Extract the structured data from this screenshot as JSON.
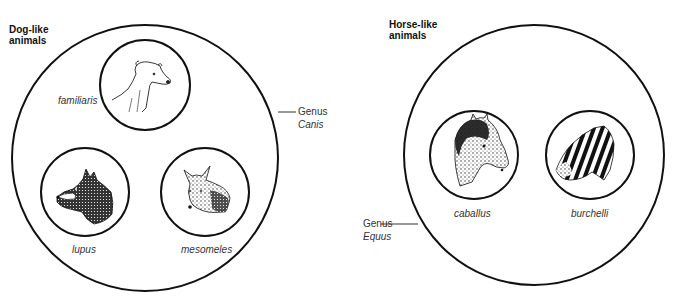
{
  "groups": [
    {
      "id": "dog",
      "title_line1": "Dog-like",
      "title_line2": "animals",
      "genus_label": "Genus",
      "genus_name": "Canis",
      "species": [
        {
          "name": "familiaris",
          "animal": "domestic dog"
        },
        {
          "name": "lupus",
          "animal": "wolf"
        },
        {
          "name": "mesomeles",
          "animal": "jackal"
        }
      ]
    },
    {
      "id": "horse",
      "title_line1": "Horse-like",
      "title_line2": "animals",
      "genus_label": "Genus",
      "genus_name": "Equus",
      "species": [
        {
          "name": "caballus",
          "animal": "horse"
        },
        {
          "name": "burchelli",
          "animal": "zebra"
        }
      ]
    }
  ],
  "colors": {
    "stroke": "#111111",
    "text": "#333333",
    "background": "#ffffff"
  }
}
